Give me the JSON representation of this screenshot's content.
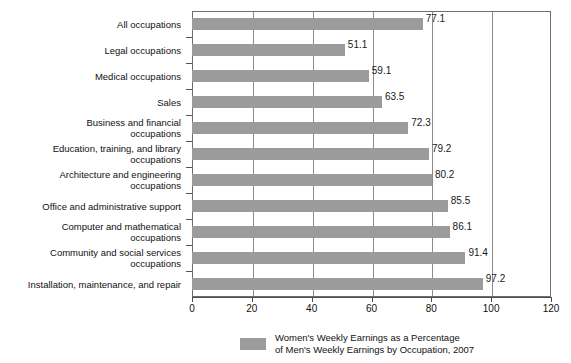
{
  "chart_data": {
    "type": "bar",
    "orientation": "horizontal",
    "title": "",
    "xlabel": "",
    "ylabel": "",
    "xlim": [
      0,
      120
    ],
    "xticks": [
      0,
      20,
      40,
      60,
      80,
      100,
      120
    ],
    "grid": true,
    "grid_axis": "x",
    "legend_position": "bottom",
    "legend": [
      "Women's Weekly Earnings as a Percentage of Men's Weekly Earnings by Occupation, 2007"
    ],
    "bar_color": "#9b9b9b",
    "categories": [
      "All occupations",
      "Legal occupations",
      "Medical occupations",
      "Sales",
      "Business and financial occupations",
      "Education, training, and library occupations",
      "Architecture and engineering occupations",
      "Office and administrative support",
      "Computer and mathematical occupations",
      "Community and social services occupations",
      "Installation, maintenance, and repair"
    ],
    "values": [
      77.1,
      51.1,
      59.1,
      63.5,
      72.3,
      79.2,
      80.2,
      85.5,
      86.1,
      91.4,
      97.2
    ],
    "value_labels": [
      "77.1",
      "51.1",
      "59.1",
      "63.5",
      "72.3",
      "79.2",
      "80.2",
      "85.5",
      "86.1",
      "91.4",
      "97.2"
    ],
    "category_lines": [
      [
        "All occupations"
      ],
      [
        "Legal occupations"
      ],
      [
        "Medical occupations"
      ],
      [
        "Sales"
      ],
      [
        "Business and financial",
        "occupations"
      ],
      [
        "Education, training, and library",
        "occupations"
      ],
      [
        "Architecture and engineering",
        "occupations"
      ],
      [
        "Office and administrative support"
      ],
      [
        "Computer and mathematical",
        "occupations"
      ],
      [
        "Community and social services",
        "occupations"
      ],
      [
        "Installation, maintenance, and repair"
      ]
    ]
  },
  "legend": {
    "line1": "Women's Weekly Earnings as a Percentage",
    "line2": "of Men's Weekly Earnings by Occupation, 2007",
    "swatch_color": "#9b9b9b"
  },
  "axis": {
    "tick_labels": [
      "0",
      "20",
      "40",
      "60",
      "80",
      "100",
      "120"
    ]
  }
}
